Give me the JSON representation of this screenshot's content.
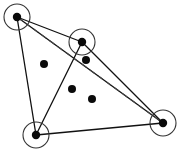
{
  "figure": {
    "width": 185,
    "height": 161,
    "background_color": "#ffffff",
    "stroke_color": "#111111",
    "dashed_stroke_color": "#444444",
    "halo_stroke_color": "#333333",
    "point_fill_color": "#0a0a0a"
  },
  "chart_data": {
    "type": "scatter",
    "subtitle": "",
    "xlabel": "",
    "ylabel": "",
    "xlim": [
      0,
      185
    ],
    "ylim": [
      0,
      161
    ],
    "grid": false,
    "legend": false,
    "legend_position": "none",
    "annotations": [],
    "tick_labels_x": [],
    "tick_labels_y": [],
    "series": [
      {
        "name": "circled-vertices",
        "marker": "filled-dot-with-circle-halo",
        "marker_radius": 4.2,
        "halo_radius": 13,
        "points": [
          {
            "id": "A",
            "x": 17,
            "y": 17,
            "label": ""
          },
          {
            "id": "B",
            "x": 82,
            "y": 42,
            "label": ""
          },
          {
            "id": "C",
            "x": 36,
            "y": 135,
            "label": ""
          },
          {
            "id": "D",
            "x": 163,
            "y": 123,
            "label": ""
          }
        ]
      },
      {
        "name": "interior-points",
        "marker": "filled-dot",
        "marker_radius": 4.0,
        "points": [
          {
            "id": "p1",
            "x": 44,
            "y": 64,
            "label": ""
          },
          {
            "id": "p2",
            "x": 86,
            "y": 60,
            "label": ""
          },
          {
            "id": "p3",
            "x": 72,
            "y": 89,
            "label": ""
          },
          {
            "id": "p4",
            "x": 92,
            "y": 99,
            "label": ""
          }
        ]
      }
    ],
    "edges": [
      {
        "id": "e1",
        "from": "A",
        "to": "B",
        "style": "solid"
      },
      {
        "id": "e2",
        "from": "A",
        "to": "C",
        "style": "solid"
      },
      {
        "id": "e3",
        "from": "A",
        "to": "D",
        "style": "solid"
      },
      {
        "id": "e4",
        "from": "B",
        "to": "C",
        "style": "solid"
      },
      {
        "id": "e5",
        "from": "B",
        "to": "D",
        "style": "solid"
      },
      {
        "id": "e6",
        "from": "C",
        "to": "D",
        "style": "solid"
      },
      {
        "id": "e7",
        "from": "A",
        "to": "D",
        "style": "dashed"
      }
    ]
  }
}
